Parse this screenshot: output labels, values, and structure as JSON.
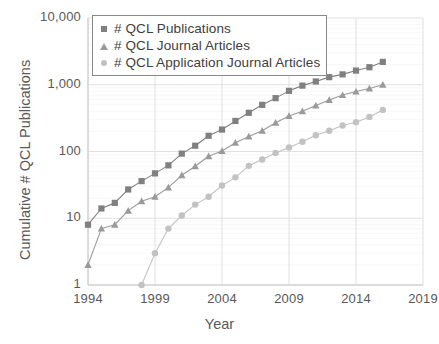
{
  "chart_data": {
    "type": "line",
    "title": "",
    "xlabel": "Year",
    "ylabel": "Cumulative # QCL Publications",
    "yscale": "log",
    "xlim": [
      1994,
      2019
    ],
    "ylim": [
      1,
      10000
    ],
    "grid": true,
    "legend_position": "top-left",
    "x_tick_labels": [
      "1994",
      "1999",
      "2004",
      "2009",
      "2014",
      "2019"
    ],
    "x_tick_values": [
      1994,
      1999,
      2004,
      2009,
      2014,
      2019
    ],
    "y_tick_labels": [
      "1",
      "10",
      "100",
      "1,000",
      "10,000"
    ],
    "y_tick_values": [
      1,
      10,
      100,
      1000,
      10000
    ],
    "series": [
      {
        "name": "# QCL Publications",
        "marker": "square",
        "color": "#808080",
        "x": [
          1994,
          1995,
          1996,
          1997,
          1998,
          1999,
          2000,
          2001,
          2002,
          2003,
          2004,
          2005,
          2006,
          2007,
          2008,
          2009,
          2010,
          2011,
          2012,
          2013,
          2014,
          2015,
          2016
        ],
        "values": [
          8,
          14,
          17,
          27,
          36,
          47,
          62,
          93,
          122,
          172,
          213,
          287,
          380,
          500,
          630,
          810,
          970,
          1120,
          1300,
          1430,
          1630,
          1830,
          2200
        ]
      },
      {
        "name": "# QCL Journal Articles",
        "marker": "triangle",
        "color": "#9a9a9a",
        "x": [
          1994,
          1995,
          1996,
          1997,
          1998,
          1999,
          2000,
          2001,
          2002,
          2003,
          2004,
          2005,
          2006,
          2007,
          2008,
          2009,
          2010,
          2011,
          2012,
          2013,
          2014,
          2015,
          2016
        ],
        "values": [
          2,
          7,
          8,
          13,
          18,
          21,
          29,
          44,
          60,
          85,
          102,
          135,
          168,
          205,
          270,
          340,
          400,
          490,
          590,
          700,
          790,
          880,
          1000
        ]
      },
      {
        "name": "# QCL Application Journal Articles",
        "marker": "circle",
        "color": "#c2c2c2",
        "x": [
          1998,
          1999,
          2000,
          2001,
          2002,
          2003,
          2004,
          2005,
          2006,
          2007,
          2008,
          2009,
          2010,
          2011,
          2012,
          2013,
          2014,
          2015,
          2016
        ],
        "values": [
          1,
          3,
          7,
          11,
          16,
          21,
          31,
          41,
          61,
          76,
          95,
          115,
          140,
          175,
          205,
          245,
          275,
          330,
          420
        ]
      }
    ]
  },
  "legend": {
    "items": [
      {
        "label": "# QCL Publications"
      },
      {
        "label": "# QCL Journal Articles"
      },
      {
        "label": "# QCL Application Journal Articles"
      }
    ]
  }
}
